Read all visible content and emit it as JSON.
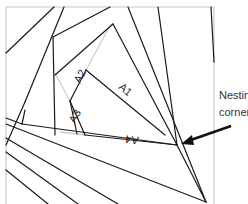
{
  "diagram": {
    "frame_color": "#c8c8c8",
    "line_color": "#1a1a1a",
    "faint_color": "#cfcfcf",
    "pieces": [
      {
        "id": "A1",
        "label": "A1"
      },
      {
        "id": "A2",
        "label": "A2"
      },
      {
        "id": "A3",
        "label": "A3"
      },
      {
        "id": "A4",
        "label": "A4"
      }
    ],
    "annotation": {
      "line1": "Nestin",
      "line2": "corner",
      "arrow": "arrow-left-icon"
    }
  }
}
